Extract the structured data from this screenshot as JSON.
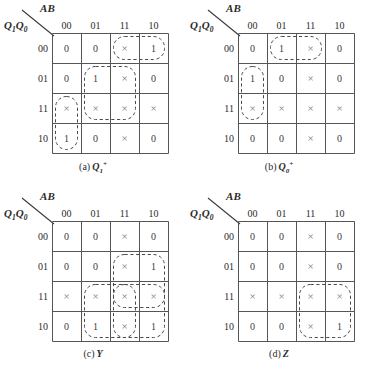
{
  "figure": {
    "axis_top_label": "AB",
    "axis_left_label_main1": "Q",
    "axis_left_sub1": "1",
    "axis_left_main2": "Q",
    "axis_left_sub2": "0",
    "column_headers": [
      "00",
      "01",
      "11",
      "10"
    ],
    "row_headers": [
      "00",
      "01",
      "11",
      "10"
    ],
    "dont_care_symbol": "×"
  },
  "chart_data": [
    {
      "type": "table",
      "title": "(a) Q₁⁺",
      "caption_index": "(a)",
      "caption_name": "Q",
      "caption_sub": "1",
      "caption_sup": "+",
      "xlabel": "AB",
      "ylabel": "Q1Q0",
      "categories": [
        "00",
        "01",
        "11",
        "10"
      ],
      "row_labels": [
        "00",
        "01",
        "11",
        "10"
      ],
      "values": [
        [
          "0",
          "0",
          "×",
          "1"
        ],
        [
          "0",
          "1",
          "×",
          "0"
        ],
        [
          "×",
          "×",
          "×",
          "×"
        ],
        [
          "1",
          "0",
          "×",
          "0"
        ]
      ],
      "groups": [
        {
          "name": "group-top-right",
          "row": 0,
          "col": 2,
          "rowspan": 1,
          "colspan": 2
        },
        {
          "name": "group-center-block",
          "row": 1,
          "col": 1,
          "rowspan": 2,
          "colspan": 2
        },
        {
          "name": "group-left-vertical",
          "row": 2,
          "col": 0,
          "rowspan": 2,
          "colspan": 1
        }
      ]
    },
    {
      "type": "table",
      "title": "(b) Q₀⁺",
      "caption_index": "(b)",
      "caption_name": "Q",
      "caption_sub": "0",
      "caption_sup": "+",
      "xlabel": "AB",
      "ylabel": "Q1Q0",
      "categories": [
        "00",
        "01",
        "11",
        "10"
      ],
      "row_labels": [
        "00",
        "01",
        "11",
        "10"
      ],
      "values": [
        [
          "0",
          "1",
          "×",
          "0"
        ],
        [
          "1",
          "0",
          "×",
          "0"
        ],
        [
          "×",
          "×",
          "×",
          "×"
        ],
        [
          "0",
          "0",
          "×",
          "0"
        ]
      ],
      "groups": [
        {
          "name": "group-top-middle",
          "row": 0,
          "col": 1,
          "rowspan": 1,
          "colspan": 2
        },
        {
          "name": "group-left-vertical",
          "row": 1,
          "col": 0,
          "rowspan": 2,
          "colspan": 1
        }
      ]
    },
    {
      "type": "table",
      "title": "(c) Y",
      "caption_index": "(c)",
      "caption_name": "Y",
      "caption_sub": "",
      "caption_sup": "",
      "xlabel": "AB",
      "ylabel": "Q1Q0",
      "categories": [
        "00",
        "01",
        "11",
        "10"
      ],
      "row_labels": [
        "00",
        "01",
        "11",
        "10"
      ],
      "values": [
        [
          "0",
          "0",
          "×",
          "0"
        ],
        [
          "0",
          "0",
          "×",
          "1"
        ],
        [
          "×",
          "×",
          "×",
          "×"
        ],
        [
          "0",
          "1",
          "×",
          "1"
        ]
      ],
      "groups": [
        {
          "name": "group-right-upper",
          "row": 1,
          "col": 2,
          "rowspan": 2,
          "colspan": 2
        },
        {
          "name": "group-bottom-wide",
          "row": 2,
          "col": 1,
          "rowspan": 2,
          "colspan": 3
        },
        {
          "name": "group-col11-vertical",
          "row": 2,
          "col": 2,
          "rowspan": 2,
          "colspan": 1
        }
      ]
    },
    {
      "type": "table",
      "title": "(d) Z",
      "caption_index": "(d)",
      "caption_name": "Z",
      "caption_sub": "",
      "caption_sup": "",
      "xlabel": "AB",
      "ylabel": "Q1Q0",
      "categories": [
        "00",
        "01",
        "11",
        "10"
      ],
      "row_labels": [
        "00",
        "01",
        "11",
        "10"
      ],
      "values": [
        [
          "0",
          "0",
          "×",
          "0"
        ],
        [
          "0",
          "0",
          "×",
          "0"
        ],
        [
          "×",
          "×",
          "×",
          "×"
        ],
        [
          "0",
          "0",
          "×",
          "1"
        ]
      ],
      "groups": [
        {
          "name": "group-bottom-right",
          "row": 2,
          "col": 2,
          "rowspan": 2,
          "colspan": 2
        }
      ]
    }
  ]
}
